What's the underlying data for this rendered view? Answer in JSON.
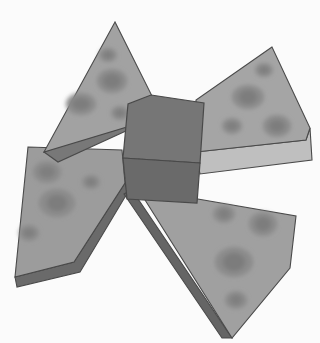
{
  "scene": {
    "title": "Grayscale 3D render of a four-winged pinwheel block",
    "width": 320,
    "height": 343,
    "background_color": "#fbfbfb",
    "object_name": "pinwheel-wedge-assembly",
    "render_style": "flat-shaded grayscale 3D",
    "alt_text": "Four triangular wedges with round dimples radiate from a dark rectangular central block"
  },
  "palette": {
    "background": "#fbfbfb",
    "wing_top_light": "#a9a9a9",
    "wing_top_mid": "#9c9c9c",
    "wing_top_dark": "#8f8f8f",
    "wing_side_light": "#b8b8b8",
    "wing_side_dark": "#6f6f6f",
    "wing_side_darkest": "#5c5c5c",
    "outline": "#4a4a4a",
    "spot_fill": "#8a8a8a",
    "spot_core": "#7e7e7e",
    "hub_top": "#737373",
    "hub_front": "#6a6a6a",
    "hub_side": "#5e5e5e",
    "hub_outline": "#4a4a4a"
  },
  "parts": [
    {
      "id": "wing-top-left",
      "label": "Top-left wedge",
      "top_face_points": "115,22 44,152 58,160 146,118 151,96",
      "side_face_points": "44,152 58,160 146,118 140,110",
      "top_fill": "#a2a2a2",
      "side_fill": "#787878",
      "spots": [
        {
          "cx": 108,
          "cy": 56,
          "rx": 9,
          "ry": 7
        },
        {
          "cx": 112,
          "cy": 82,
          "rx": 15,
          "ry": 12
        },
        {
          "cx": 81,
          "cy": 104,
          "rx": 15,
          "ry": 11
        },
        {
          "cx": 120,
          "cy": 114,
          "rx": 9,
          "ry": 7
        }
      ]
    },
    {
      "id": "wing-top-right",
      "label": "Top-right wedge",
      "top_face_points": "272,47 198,96 196,158 300,145 308,133",
      "side_face_points": "196,158 300,145 308,133 310,128 305,160 200,172",
      "top_fill": "#a5a5a5",
      "side_fill": "#bfbfbf",
      "spots": [
        {
          "cx": 264,
          "cy": 70,
          "rx": 9,
          "ry": 7
        },
        {
          "cx": 248,
          "cy": 97,
          "rx": 15,
          "ry": 12
        },
        {
          "cx": 232,
          "cy": 126,
          "rx": 10,
          "ry": 7
        },
        {
          "cx": 276,
          "cy": 126,
          "rx": 14,
          "ry": 11
        }
      ]
    },
    {
      "id": "wing-bottom-left",
      "label": "Bottom-left wedge",
      "top_face_points": "28,147 122,150 125,183 74,262 15,277",
      "side_face_points": "15,277 74,262 125,183 128,192 80,272 17,287",
      "top_fill": "#9c9c9c",
      "side_fill": "#6b6b6b",
      "spots": [
        {
          "cx": 47,
          "cy": 172,
          "rx": 14,
          "ry": 11
        },
        {
          "cx": 91,
          "cy": 182,
          "rx": 9,
          "ry": 7
        },
        {
          "cx": 57,
          "cy": 203,
          "rx": 18,
          "ry": 14
        },
        {
          "cx": 29,
          "cy": 233,
          "rx": 10,
          "ry": 8
        }
      ]
    },
    {
      "id": "wing-bottom-right",
      "label": "Bottom-right wedge",
      "top_face_points": "136,192 188,198 296,215 292,266 232,338 140,200",
      "side_face_points": "136,192 232,338 224,338 128,196",
      "top_fill": "#a0a0a0",
      "side_fill": "#656565",
      "spots": [
        {
          "cx": 224,
          "cy": 215,
          "rx": 11,
          "ry": 9
        },
        {
          "cx": 263,
          "cy": 224,
          "rx": 14,
          "ry": 12
        },
        {
          "cx": 234,
          "cy": 263,
          "rx": 19,
          "ry": 15
        },
        {
          "cx": 236,
          "cy": 300,
          "rx": 11,
          "ry": 9
        }
      ]
    }
  ],
  "hub": {
    "id": "central-block",
    "label": "Central rectangular block",
    "top_face_points": "151,95 204,103 200,163 123,158 128,104",
    "front_face_points": "123,158 200,163 197,203 127,199",
    "top_fill": "#767676",
    "front_fill": "#6a6a6a",
    "outline": "#4a4a4a"
  }
}
